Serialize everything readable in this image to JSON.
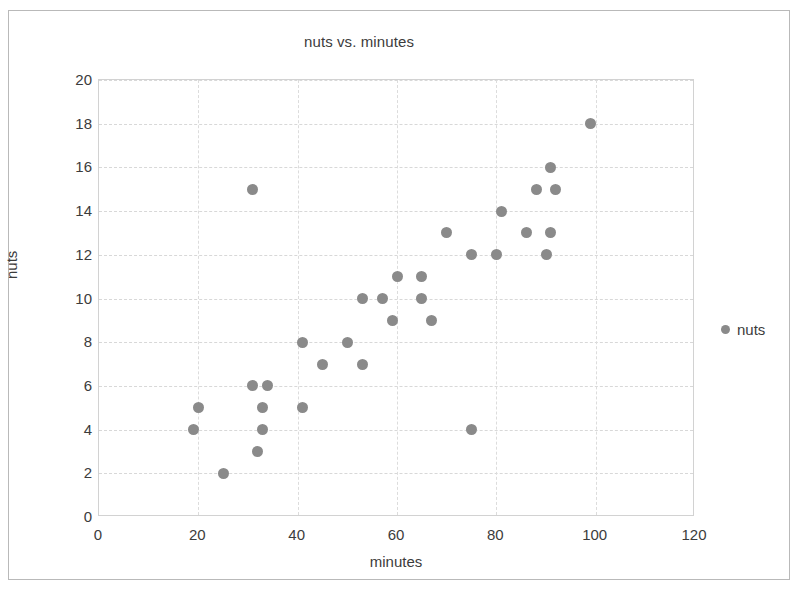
{
  "chart_data": {
    "type": "scatter",
    "title": "nuts vs. minutes",
    "xlabel": "minutes",
    "ylabel": "nuts",
    "xlim": [
      0,
      120
    ],
    "ylim": [
      0,
      20
    ],
    "xticks": [
      0,
      20,
      40,
      60,
      80,
      100,
      120
    ],
    "yticks": [
      0,
      2,
      4,
      6,
      8,
      10,
      12,
      14,
      16,
      18,
      20
    ],
    "grid": true,
    "legend_position": "right",
    "series": [
      {
        "name": "nuts",
        "color": "#8a8a8a",
        "marker": "circle",
        "points": [
          [
            19,
            4
          ],
          [
            20,
            5
          ],
          [
            25,
            2
          ],
          [
            31,
            6
          ],
          [
            31,
            15
          ],
          [
            32,
            3
          ],
          [
            33,
            4
          ],
          [
            33,
            5
          ],
          [
            34,
            6
          ],
          [
            41,
            5
          ],
          [
            41,
            8
          ],
          [
            45,
            7
          ],
          [
            50,
            8
          ],
          [
            53,
            7
          ],
          [
            53,
            10
          ],
          [
            57,
            10
          ],
          [
            59,
            9
          ],
          [
            60,
            11
          ],
          [
            65,
            10
          ],
          [
            65,
            11
          ],
          [
            67,
            9
          ],
          [
            70,
            13
          ],
          [
            75,
            4
          ],
          [
            75,
            12
          ],
          [
            80,
            12
          ],
          [
            81,
            14
          ],
          [
            86,
            13
          ],
          [
            88,
            15
          ],
          [
            90,
            12
          ],
          [
            91,
            13
          ],
          [
            91,
            16
          ],
          [
            92,
            15
          ],
          [
            99,
            18
          ]
        ]
      }
    ]
  },
  "legend": {
    "entries": [
      {
        "label": "nuts",
        "marker": "circle-marker-icon"
      }
    ]
  }
}
